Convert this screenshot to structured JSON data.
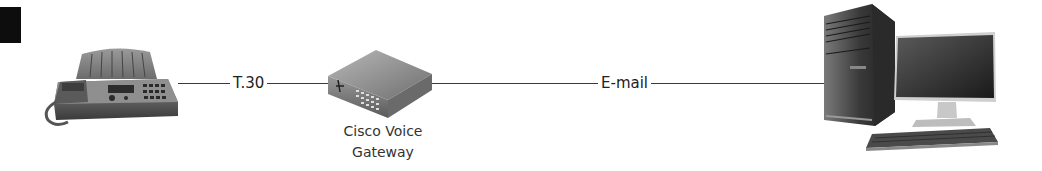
{
  "diagram": {
    "type": "network-flow",
    "nodes": [
      {
        "id": "fax",
        "label": "",
        "icon": "fax-machine-icon"
      },
      {
        "id": "gateway",
        "label": "Cisco Voice Gateway",
        "label_lines": [
          "Cisco Voice",
          "Gateway"
        ],
        "icon": "voice-gateway-router-icon"
      },
      {
        "id": "pc",
        "label": "",
        "icon": "desktop-computer-icon"
      }
    ],
    "edges": [
      {
        "from": "fax",
        "to": "gateway",
        "label": "T.30"
      },
      {
        "from": "gateway",
        "to": "pc",
        "label": "E-mail"
      }
    ],
    "colors": {
      "line": "#3a3a3a",
      "text": "#222222",
      "corner_block": "#0d0d0d",
      "background": "#ffffff"
    }
  }
}
